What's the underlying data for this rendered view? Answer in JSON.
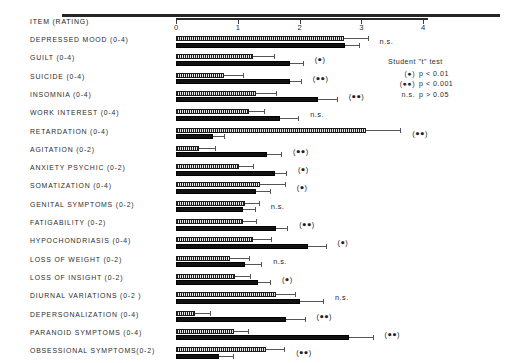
{
  "chart_data": {
    "type": "bar",
    "orientation": "horizontal",
    "title": "",
    "xlabel": "",
    "ylabel": "ITEM (RATING)",
    "xlim": [
      0,
      4.3
    ],
    "xticks": [
      0,
      1,
      2,
      3,
      4
    ],
    "xticklabels": [
      "0",
      "1",
      "2",
      "3",
      "4"
    ],
    "grid": false,
    "legend_position": "top-right",
    "header": "ITEM (RATING)",
    "series": [
      {
        "name": "hatched",
        "style": "stippled"
      },
      {
        "name": "solid",
        "style": "filled-black"
      }
    ],
    "categories": [
      "DEPRESSED MOOD (0-4)",
      "GUILT  (0-4)",
      "SUICIDE  (0-4)",
      "INSOMNIA (0-4)",
      "WORK INTEREST (0-4)",
      "RETARDATION  (0-4)",
      "AGITATION (0-2)",
      "ANXIETY PSYCHIC (0-2)",
      "SOMATIZATION (0-4)",
      "GENITAL SYMPTOMS (0-2)",
      "FATIGABILITY (0-2)",
      "HYPOCHONDRIASIS (0-4)",
      "LOSS OF WEIGHT (0-2)",
      "LOSS  OF  INSIGHT (0-2)",
      "DIURNAL VARIATIONS (0-2 )",
      "DEPERSONALIZATION (0-4)",
      "PARANOID SYMPTOMS (0-4)",
      "OBSESSIONAL SYMPTOMS(0-2)"
    ],
    "rows": [
      {
        "category": "DEPRESSED MOOD (0-4)",
        "hatched": 2.72,
        "hatched_err": 0.38,
        "solid": 2.74,
        "solid_err": 0.22,
        "significance": "n.s."
      },
      {
        "category": "GUILT  (0-4)",
        "hatched": 1.25,
        "hatched_err": 0.33,
        "solid": 1.85,
        "solid_err": 0.2,
        "significance": "(●)"
      },
      {
        "category": "SUICIDE  (0-4)",
        "hatched": 0.78,
        "hatched_err": 0.3,
        "solid": 1.84,
        "solid_err": 0.18,
        "significance": "(●●)"
      },
      {
        "category": "INSOMNIA (0-4)",
        "hatched": 1.3,
        "hatched_err": 0.32,
        "solid": 2.3,
        "solid_err": 0.3,
        "significance": "(●●)"
      },
      {
        "category": "WORK INTEREST (0-4)",
        "hatched": 1.18,
        "hatched_err": 0.25,
        "solid": 1.68,
        "solid_err": 0.3,
        "significance": "n.s."
      },
      {
        "category": "RETARDATION  (0-4)",
        "hatched": 3.08,
        "hatched_err": 0.55,
        "solid": 0.6,
        "solid_err": 0.18,
        "significance": "(●●)"
      },
      {
        "category": "AGITATION (0-2)",
        "hatched": 0.38,
        "hatched_err": 0.25,
        "solid": 1.48,
        "solid_err": 0.22,
        "significance": "(●●)"
      },
      {
        "category": "ANXIETY PSYCHIC (0-2)",
        "hatched": 1.02,
        "hatched_err": 0.22,
        "solid": 1.6,
        "solid_err": 0.18,
        "significance": "(●)"
      },
      {
        "category": "SOMATIZATION (0-4)",
        "hatched": 1.36,
        "hatched_err": 0.4,
        "solid": 1.3,
        "solid_err": 0.22,
        "significance": "(●)"
      },
      {
        "category": "GENITAL SYMPTOMS (0-2)",
        "hatched": 1.12,
        "hatched_err": 0.22,
        "solid": 1.08,
        "solid_err": 0.2,
        "significance": "n.s."
      },
      {
        "category": "FATIGABILITY (0-2)",
        "hatched": 1.08,
        "hatched_err": 0.22,
        "solid": 1.62,
        "solid_err": 0.18,
        "significance": "(●●)"
      },
      {
        "category": "HYPOCHONDRIASIS (0-4)",
        "hatched": 1.24,
        "hatched_err": 0.3,
        "solid": 2.14,
        "solid_err": 0.28,
        "significance": "(●)"
      },
      {
        "category": "LOSS OF WEIGHT (0-2)",
        "hatched": 0.88,
        "hatched_err": 0.3,
        "solid": 1.12,
        "solid_err": 0.26,
        "significance": "n.s."
      },
      {
        "category": "LOSS  OF  INSIGHT (0-2)",
        "hatched": 0.95,
        "hatched_err": 0.24,
        "solid": 1.32,
        "solid_err": 0.2,
        "significance": "(●)"
      },
      {
        "category": "DIURNAL VARIATIONS (0-2 )",
        "hatched": 1.62,
        "hatched_err": 0.3,
        "solid": 2.0,
        "solid_err": 0.38,
        "significance": "n.s."
      },
      {
        "category": "DEPERSONALIZATION (0-4)",
        "hatched": 0.3,
        "hatched_err": 0.25,
        "solid": 1.78,
        "solid_err": 0.3,
        "significance": "(●●)"
      },
      {
        "category": "PARANOID SYMPTOMS (0-4)",
        "hatched": 0.94,
        "hatched_err": 0.22,
        "solid": 2.8,
        "solid_err": 0.38,
        "significance": "(●●)"
      },
      {
        "category": "OBSESSIONAL SYMPTOMS(0-2)",
        "hatched": 1.45,
        "hatched_err": 0.3,
        "solid": 0.7,
        "solid_err": 0.22,
        "significance": "(●●)"
      }
    ],
    "annotations": [
      "n.s.",
      "(●)",
      "(●●)",
      "(●●)",
      "n.s.",
      "(●●)",
      "(●●)",
      "(●)",
      "(●)",
      "n.s.",
      "(●●)",
      "(●)",
      "n.s.",
      "(●)",
      "n.s.",
      "(●●)",
      "(●●)",
      "(●●)"
    ]
  },
  "legend": {
    "title": "Student \"t\" test",
    "entries": [
      {
        "tag": "(●)",
        "text": "p < 0.01"
      },
      {
        "tag": "(●●)",
        "text": "p < 0.001"
      },
      {
        "tag": "n.s.",
        "text": "p > 0.05"
      }
    ]
  },
  "colors": {
    "ink": "#1a1a1a",
    "axis": "#2b2b2b",
    "bar_solid": "#111111",
    "bar_hatched": "#d8d8d8",
    "error": "#555555",
    "background": "#ffffff"
  }
}
